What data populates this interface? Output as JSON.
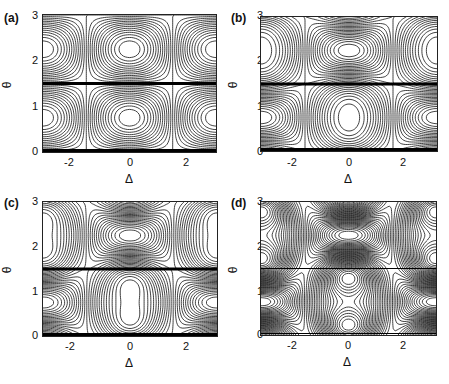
{
  "chart_data": [
    {
      "type": "contour",
      "panel": "(a)",
      "xlabel": "Δ",
      "ylabel": "θ",
      "xlim": [
        -3.1416,
        3.1416
      ],
      "ylim": [
        0,
        3.1416
      ],
      "xticks": [
        "-2",
        "0",
        "2"
      ],
      "yticks": [
        "0",
        "1",
        "2",
        "3"
      ],
      "lambda": 0.0,
      "features": "separatrix at θ=π/2 and diagonal |Δ|≈π/2 lines; closed orbits centered at (0,≈0.8) and (±π,≈2.35)"
    },
    {
      "type": "contour",
      "panel": "(b)",
      "xlabel": "Δ",
      "ylabel": "θ",
      "xlim": [
        -3.1416,
        3.1416
      ],
      "ylim": [
        0,
        3.1416
      ],
      "xticks": [
        "-2",
        "0",
        "2"
      ],
      "yticks": [
        "0",
        "1",
        "2",
        "3"
      ],
      "lambda": 0.35,
      "features": "X-shaped saddle at (0,≈2.35) and (±π,≈0.8); small islands near (0,≈3) and (0,≈1.9)"
    },
    {
      "type": "contour",
      "panel": "(c)",
      "xlabel": "Δ",
      "ylabel": "θ",
      "xlim": [
        -3.1416,
        3.1416
      ],
      "ylim": [
        0,
        3.1416
      ],
      "xticks": [
        "-2",
        "0",
        "2"
      ],
      "yticks": [
        "0",
        "1",
        "2",
        "3"
      ],
      "lambda": 0.6,
      "features": "clear X-crossing separatrix at (0,≈2.35); islands above and below"
    },
    {
      "type": "contour",
      "panel": "(d)",
      "xlabel": "Δ",
      "ylabel": "θ",
      "xlim": [
        -3.1416,
        3.1416
      ],
      "ylim": [
        0,
        3.1416
      ],
      "xticks": [
        "-2",
        "0",
        "2"
      ],
      "yticks": [
        "0",
        "1",
        "2",
        "3"
      ],
      "lambda": 1.1,
      "features": "dense contours; large empty ellipse at (0,≈0.8) and half-ellipses at (±π,≈2.35)"
    }
  ],
  "panels": [
    {
      "label": "(a)"
    },
    {
      "label": "(b)"
    },
    {
      "label": "(c)"
    },
    {
      "label": "(d)"
    }
  ],
  "axes": {
    "xlabel": "Δ",
    "ylabel": "θ",
    "xticks": [
      "-2",
      "0",
      "2"
    ],
    "yticks": [
      "0",
      "1",
      "2",
      "3"
    ]
  }
}
